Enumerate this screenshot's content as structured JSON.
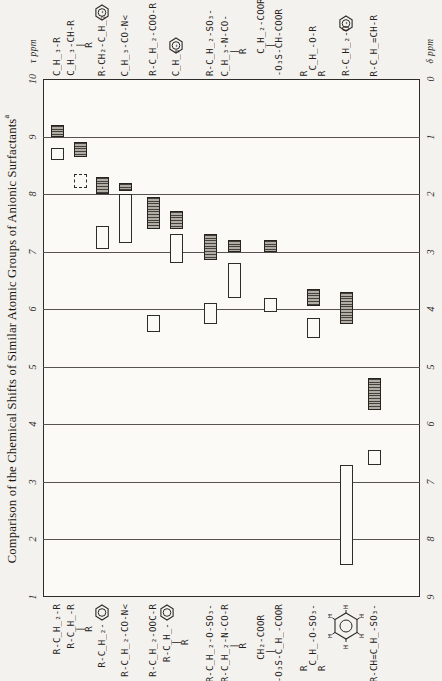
{
  "title": {
    "text": "Comparison of the Chemical Shifts of Similar Atomic Groups of Anionic Surfactants",
    "superscript": "a"
  },
  "axes": {
    "tau_unit": "τ ppm",
    "delta_unit": "δ ppm",
    "tau_ticks": [
      "10",
      "9",
      "8",
      "7",
      "6",
      "5",
      "4",
      "3",
      "2",
      "1"
    ],
    "delta_ticks": [
      "0",
      "1",
      "2",
      "3",
      "4",
      "5",
      "6",
      "7",
      "8",
      "9"
    ]
  },
  "chart_data": {
    "type": "bar",
    "subtype": "floating-range-boxes",
    "orientation": "figure printed rotated 90°: τ scale runs vertically 10 (top) to 1 (bottom), δ scale 0 (top) to 9 (bottom)",
    "tau_axis_range": [
      10,
      1
    ],
    "delta_axis_range": [
      0,
      9
    ],
    "grid": "line at every 1 ppm",
    "encoding": {
      "hatched_box": "shift range of upper formula",
      "open_box": "shift range of lower formula"
    },
    "pixel_frame": {
      "left": 43,
      "top": 79,
      "right": 420,
      "bottom": 597,
      "label_base_top": 76,
      "label_base_bottom": 604
    },
    "groups": [
      {
        "x_center": 57,
        "top_formula": "C̲H̲₃-R",
        "bottom_formula": "R-C̲H̲₂-R",
        "hatched_tau": [
          9.2,
          9.0
        ],
        "open_tau": [
          8.8,
          8.6
        ],
        "open_box_style": "solid",
        "top_ring": null,
        "bottom_ring": null
      },
      {
        "x_center": 80,
        "top_formula": "C̲H̲₃-CH-R\n     |  \n     R  ",
        "bottom_formula": "R-C̲H̲-R\n   |  \n   R  ",
        "hatched_tau": [
          8.9,
          8.65
        ],
        "open_tau": [
          8.35,
          8.1
        ],
        "open_box_style": "dashed",
        "top_ring": null,
        "bottom_ring": null
      },
      {
        "x_center": 102,
        "top_formula": "R-CH₂-C̲H̲₂-",
        "bottom_formula": "R-C̲H̲₂-",
        "hatched_tau": [
          8.3,
          8.0
        ],
        "open_tau": [
          7.45,
          7.05
        ],
        "open_box_style": "solid",
        "top_ring": "benzene",
        "bottom_ring": "benzene"
      },
      {
        "x_center": 125,
        "top_formula": "C̲H̲₃-CO-N<",
        "bottom_formula": "R-C̲H̲₂-CO-N<",
        "hatched_tau": [
          8.2,
          8.05
        ],
        "open_tau": [
          8.0,
          7.15
        ],
        "open_box_style": "solid",
        "top_ring": null,
        "bottom_ring": null
      },
      {
        "x_center": 153,
        "top_formula": "R-C̲H̲₂-COO-R",
        "bottom_formula": "R-C̲H̲₂-OOC-R",
        "hatched_tau": [
          7.95,
          7.4
        ],
        "open_tau": [
          5.9,
          5.6
        ],
        "open_box_style": "solid",
        "top_ring": null,
        "bottom_ring": null
      },
      {
        "x_center": 176,
        "top_formula": "C̲H̲₃-",
        "bottom_formula": "R-C̲H̲-\n   | \n   R ",
        "hatched_tau": [
          7.7,
          7.4
        ],
        "open_tau": [
          7.3,
          6.8
        ],
        "open_box_style": "solid",
        "top_ring": "benzene",
        "bottom_ring": "benzene"
      },
      {
        "x_center": 210,
        "top_formula": "R-C̲H̲₂-SO₃-",
        "bottom_formula": "R-C̲H̲₂-O-SO₃-",
        "hatched_tau": [
          7.3,
          6.85
        ],
        "open_tau": [
          6.1,
          5.75
        ],
        "open_box_style": "solid",
        "top_ring": null,
        "bottom_ring": null
      },
      {
        "x_center": 234,
        "top_formula": "C̲H̲₃-N-CO-\n    |    \n    R    ",
        "bottom_formula": "R-C̲H̲₂-N-CO-R\n      |     \n      R     ",
        "hatched_tau": [
          7.2,
          7.0
        ],
        "open_tau": [
          6.8,
          6.2
        ],
        "open_box_style": "solid",
        "top_ring": null,
        "bottom_ring": null
      },
      {
        "x_center": 270,
        "top_formula": "    C̲H̲₂-COOR\n     |      \n-O₃S-CH-COOR",
        "bottom_formula": "    CH₂-COOR\n     |      \n-O₃S-C̲H̲-COOR",
        "hatched_tau": [
          7.2,
          7.0
        ],
        "open_tau": [
          6.2,
          5.95
        ],
        "open_box_style": "solid",
        "top_ring": null,
        "bottom_ring": null
      },
      {
        "x_center": 313,
        "top_formula": "R      \n C̲H̲-O-R\nR      ",
        "bottom_formula": "R         \n C̲H̲-O-SO₃-\nR         ",
        "hatched_tau": [
          6.35,
          6.05
        ],
        "open_tau": [
          5.85,
          5.5
        ],
        "open_box_style": "solid",
        "top_ring": null,
        "bottom_ring": null
      },
      {
        "x_center": 346,
        "top_formula": "R-C̲H̲₂-O-",
        "bottom_formula": "",
        "bottom_formula_note": "benzene ring drawn with H atoms (aromatic ring H)",
        "hatched_tau": [
          6.3,
          5.75
        ],
        "open_tau": [
          3.3,
          1.55
        ],
        "open_box_style": "solid",
        "top_ring": "benzene",
        "bottom_ring": "benzene-H"
      },
      {
        "x_center": 374,
        "top_formula": "R-C̲H̲=CH-R",
        "bottom_formula": "R-CH=C̲H̲-SO₃-",
        "hatched_tau": [
          4.8,
          4.25
        ],
        "open_tau": [
          3.55,
          3.3
        ],
        "open_box_style": "solid",
        "top_ring": null,
        "bottom_ring": null
      }
    ]
  }
}
